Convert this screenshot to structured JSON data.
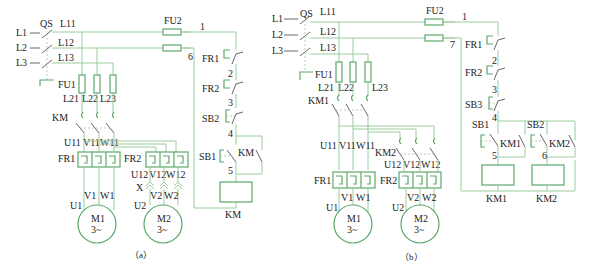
{
  "diagram_a": {
    "caption": "（a）",
    "supply": [
      "L1",
      "L2",
      "L3"
    ],
    "switch": "QS",
    "lines_main": [
      "L11",
      "L12",
      "L13"
    ],
    "fuse_main": "FU1",
    "fuse_out": [
      "L21",
      "L22",
      "L23"
    ],
    "fuse_ctrl": "FU2",
    "contactor": "KM",
    "m1_terminals_top": [
      "U11",
      "V11",
      "W11"
    ],
    "overload_1": "FR1",
    "overload_2": "FR2",
    "m2_terminals_top": [
      "U12",
      "V12",
      "W12"
    ],
    "plug": "X",
    "motor1": {
      "name": "M1",
      "type": "3~",
      "terminals": [
        "U1",
        "V1",
        "W1"
      ]
    },
    "motor2": {
      "name": "M2",
      "type": "3~",
      "terminals": [
        "U2",
        "V2",
        "W2"
      ]
    },
    "control": {
      "node1": "1",
      "node6": "6",
      "fr1": "FR1",
      "node2": "2",
      "fr2": "FR2",
      "node3": "3",
      "stop": "SB2",
      "node4": "4",
      "start": "SB1",
      "hold": "KM",
      "node5": "5",
      "coil": "KM"
    }
  },
  "diagram_b": {
    "caption": "（b）",
    "supply": [
      "L1",
      "L2",
      "L3"
    ],
    "switch": "QS",
    "lines_main": [
      "L11",
      "L12",
      "L13"
    ],
    "fuse_main": "FU1",
    "fuse_out": [
      "L21",
      "L22",
      "L23"
    ],
    "fuse_ctrl": "FU2",
    "contactor_1": "KM1",
    "contactor_2": "KM2",
    "m1_terminals_top": [
      "U11",
      "V11",
      "W11"
    ],
    "m2_terminals_top": [
      "U12",
      "V12",
      "W12"
    ],
    "overload_1": "FR1",
    "overload_2": "FR2",
    "motor1": {
      "name": "M1",
      "type": "3~",
      "terminals": [
        "U1",
        "V1",
        "W1"
      ]
    },
    "motor2": {
      "name": "M2",
      "type": "3~",
      "terminals": [
        "U2",
        "V2",
        "W2"
      ]
    },
    "control": {
      "node1": "1",
      "node7": "7",
      "fr1": "FR1",
      "node2": "2",
      "fr2": "FR2",
      "node3": "3",
      "stop": "SB3",
      "node4": "4",
      "start1": "SB1",
      "hold1": "KM1",
      "start2": "SB2",
      "hold2": "KM2",
      "node5": "5",
      "node6": "6",
      "coil1": "KM1",
      "coil2": "KM2"
    }
  },
  "colors": {
    "wire": "#9ccc9c",
    "component": "#5aa86a",
    "text": "#222222"
  }
}
